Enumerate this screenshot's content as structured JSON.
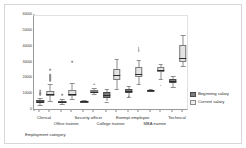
{
  "chart_data": {
    "type": "box",
    "title": "",
    "xlabel": "Employment category",
    "ylabel": "",
    "ylim": [
      0,
      60000
    ],
    "yticks": [
      0,
      10000,
      20000,
      30000,
      40000,
      50000,
      60000
    ],
    "ytick_labels": [
      "0",
      "10000",
      "20000",
      "30000",
      "40000",
      "50000",
      "60000"
    ],
    "grid": false,
    "legend_position": "right",
    "categories": [
      "Clerical",
      "Office trainee",
      "Security officer",
      "College trainee",
      "Exempt employee",
      "MBA trainee",
      "Technical"
    ],
    "series": [
      {
        "name": "Beginning salary",
        "color": "#7d7d7d",
        "boxes": [
          {
            "category": "Clerical",
            "min": 3600,
            "q1": 5400,
            "median": 6000,
            "q3": 6900,
            "max": 8400,
            "outliers": [
              9000,
              9600,
              10200,
              11400
            ]
          },
          {
            "category": "Office trainee",
            "min": 4200,
            "q1": 5400,
            "median": 6000,
            "q3": 6600,
            "max": 7800,
            "outliers": [
              9000
            ]
          },
          {
            "category": "Security officer",
            "min": 5400,
            "q1": 6000,
            "median": 6300,
            "q3": 6600,
            "max": 7200,
            "outliers": []
          },
          {
            "category": "College trainee",
            "min": 6000,
            "q1": 8400,
            "median": 10200,
            "q3": 12000,
            "max": 13800,
            "outliers": []
          },
          {
            "category": "Exempt employee",
            "min": 9000,
            "q1": 11400,
            "median": 12600,
            "q3": 13800,
            "max": 15600,
            "outliers": [
              7800
            ]
          },
          {
            "category": "MBA trainee",
            "min": 12600,
            "q1": 12900,
            "median": 13200,
            "q3": 13500,
            "max": 13800,
            "outliers": []
          },
          {
            "category": "Technical",
            "min": 15000,
            "q1": 17400,
            "median": 18900,
            "q3": 20400,
            "max": 22200,
            "outliers": []
          }
        ]
      },
      {
        "name": "Current salary",
        "color": "#e3e3e3",
        "boxes": [
          {
            "category": "Clerical",
            "min": 6300,
            "q1": 9600,
            "median": 10800,
            "q3": 12600,
            "max": 16800,
            "outliers": [
              18000,
              18600,
              19200,
              19800,
              20400,
              21000,
              21600,
              24600
            ]
          },
          {
            "category": "Office trainee",
            "min": 7800,
            "q1": 9600,
            "median": 10800,
            "q3": 13200,
            "max": 17400,
            "outliers": [
              30000
            ]
          },
          {
            "category": "Security officer",
            "min": 10800,
            "q1": 11700,
            "median": 12300,
            "q3": 13200,
            "max": 14400,
            "outliers": [
              15600
            ]
          },
          {
            "category": "College trainee",
            "min": 13800,
            "q1": 19800,
            "median": 22500,
            "q3": 26400,
            "max": 33000,
            "outliers": []
          },
          {
            "category": "Exempt employee",
            "min": 16800,
            "q1": 21600,
            "median": 23400,
            "q3": 27600,
            "max": 32400,
            "outliers": [
              36600,
              37800,
              38400,
              39000
            ]
          },
          {
            "category": "MBA trainee",
            "min": 20400,
            "q1": 24600,
            "median": 25800,
            "q3": 27600,
            "max": 29400,
            "outliers": [
              15000
            ]
          },
          {
            "category": "Technical",
            "min": 28200,
            "q1": 31200,
            "median": 33600,
            "q3": 42000,
            "max": 48000,
            "outliers": []
          }
        ]
      }
    ]
  },
  "legend": {
    "items": [
      {
        "label": "Beginning salary",
        "swatch": "begin"
      },
      {
        "label": "Current salary",
        "swatch": "current"
      }
    ]
  },
  "xaxis": {
    "title": "Employment category",
    "tick_numbers": [
      "1",
      "2",
      "3",
      "4",
      "5",
      "6",
      "7"
    ]
  }
}
